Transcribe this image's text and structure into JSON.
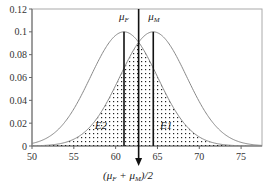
{
  "chart_data": {
    "type": "line",
    "title": "",
    "xlabel": "",
    "ylabel": "",
    "xlim": [
      50,
      77.5
    ],
    "ylim": [
      0,
      0.12
    ],
    "grid": false,
    "x_ticks": [
      "50",
      "55",
      "60",
      "65",
      "70",
      "75"
    ],
    "y_ticks": [
      "0",
      "0.02",
      "0.04",
      "0.06",
      "0.08",
      "0.1",
      "0.12"
    ],
    "series": [
      {
        "name": "female distribution",
        "distribution": "normal",
        "mean": 61,
        "sd": 4,
        "peak": 0.1,
        "color": "#888888"
      },
      {
        "name": "male distribution",
        "distribution": "normal",
        "mean": 64.5,
        "sd": 4,
        "peak": 0.1,
        "color": "#888888"
      }
    ],
    "shaded_region": {
      "description": "overlap area under both curves, dotted fill",
      "pattern": "dots"
    },
    "annotations": [
      {
        "label": "μ_F",
        "x": 61,
        "type": "vertical-line"
      },
      {
        "label": "μ_M",
        "x": 64.5,
        "type": "vertical-line"
      },
      {
        "label": "(μ_F + μ_M)/2",
        "x": 62.75,
        "type": "vertical-arrow"
      },
      {
        "label": "E2",
        "x": 57.5,
        "y": 0.018
      },
      {
        "label": "E1",
        "x": 65.3,
        "y": 0.018
      }
    ]
  },
  "labels": {
    "mu_f": "μ",
    "mu_f_sub": "F",
    "mu_m": "μ",
    "mu_m_sub": "M",
    "e1": "E1",
    "e2": "E2",
    "midpoint_open": "(μ",
    "midpoint_sub1": "F",
    "midpoint_plus": " + μ",
    "midpoint_sub2": "M",
    "midpoint_close": ")/2"
  }
}
